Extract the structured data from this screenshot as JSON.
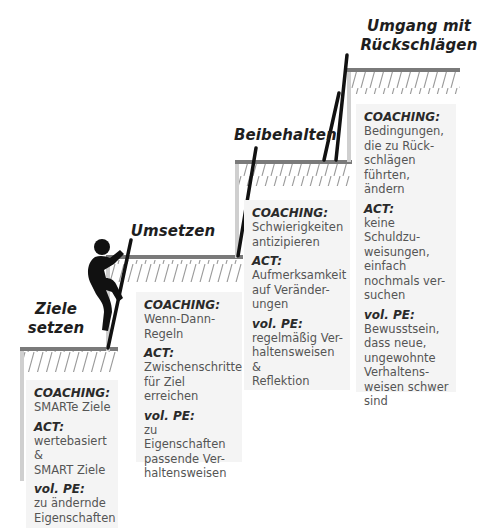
{
  "colors": {
    "step_line": "#7a7a7a",
    "wall": "#cfcfcf",
    "hatch": "#9a9a9a",
    "ladder": "#111111",
    "panel_bg": "#f4f4f4",
    "title": "#1e1e1e",
    "body_text": "#555555"
  },
  "steps": [
    {
      "title": "Ziele\nsetzen",
      "blocks": [
        {
          "label": "COACHING:",
          "text": "SMARTe Ziele"
        },
        {
          "label": "ACT:",
          "text": "wertebasiert &\nSMART Ziele"
        },
        {
          "label": "vol. PE:",
          "text": "zu ändernde\nEigenschaften"
        }
      ]
    },
    {
      "title": "Umsetzen",
      "blocks": [
        {
          "label": "COACHING:",
          "text": "Wenn-Dann-\nRegeln"
        },
        {
          "label": "ACT:",
          "text": "Zwischenschritte\nfür Ziel erreichen"
        },
        {
          "label": "vol. PE:",
          "text": "zu Eigenschaften\npassende Ver-\nhaltensweisen"
        }
      ]
    },
    {
      "title": "Beibehalten",
      "blocks": [
        {
          "label": "COACHING:",
          "text": "Schwierigkeiten\nantizipieren"
        },
        {
          "label": "ACT:",
          "text": "Aufmerksamkeit\nauf Veränder-\nungen"
        },
        {
          "label": "vol. PE:",
          "text": "regelmäßig Ver-\nhaltensweisen &\nReflektion"
        }
      ]
    },
    {
      "title": "Umgang mit\nRückschlägen",
      "blocks": [
        {
          "label": "COACHING:",
          "text": "Bedingungen,\ndie zu Rück-\nschlägen\nführten, ändern"
        },
        {
          "label": "ACT:",
          "text": "keine Schuldzu-\nweisungen,\neinfach\nnochmals ver-\nsuchen"
        },
        {
          "label": "vol. PE:",
          "text": "Bewusstsein,\ndass neue,\nungewohnte\nVerhaltens-\nweisen schwer\nsind"
        }
      ]
    }
  ],
  "figure": {
    "icon": "climbing-person-icon"
  }
}
